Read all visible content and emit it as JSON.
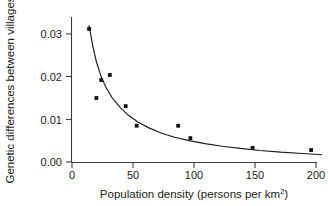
{
  "chart_data": {
    "type": "scatter",
    "title": "",
    "xlabel": "Population density (persons per km2)",
    "xlabel_base": "Population density (persons per km",
    "xlabel_sup": "2",
    "xlabel_tail": ")",
    "ylabel": "Genetic differences between villages",
    "xlim": [
      0,
      205
    ],
    "ylim": [
      0,
      0.0335
    ],
    "grid": false,
    "legend": "none",
    "xticks": [
      0,
      50,
      100,
      150,
      200
    ],
    "xticklabels": [
      "0",
      "50",
      "100",
      "150",
      "200"
    ],
    "yticks": [
      0.0,
      0.01,
      0.02,
      0.03
    ],
    "yticklabels": [
      "0.00",
      "0.01",
      "0.02",
      "0.03"
    ],
    "points": [
      {
        "x": 14,
        "y": 0.0312
      },
      {
        "x": 20,
        "y": 0.015
      },
      {
        "x": 24,
        "y": 0.0192
      },
      {
        "x": 31,
        "y": 0.0204
      },
      {
        "x": 44,
        "y": 0.0131
      },
      {
        "x": 53,
        "y": 0.0085
      },
      {
        "x": 87,
        "y": 0.0085
      },
      {
        "x": 97,
        "y": 0.0056
      },
      {
        "x": 148,
        "y": 0.0033
      },
      {
        "x": 196,
        "y": 0.0028
      }
    ],
    "series": [
      {
        "name": "fitted decay curve",
        "x": [
          14,
          17,
          20,
          24,
          28,
          33,
          39,
          46,
          54,
          63,
          73,
          84,
          96,
          109,
          123,
          138,
          154,
          171,
          189,
          205
        ],
        "y": [
          0.032,
          0.0272,
          0.0235,
          0.0199,
          0.0174,
          0.015,
          0.0129,
          0.011,
          0.0094,
          0.008,
          0.0068,
          0.0058,
          0.005,
          0.0043,
          0.0037,
          0.0032,
          0.0027,
          0.0023,
          0.002,
          0.0017
        ]
      }
    ]
  },
  "colors": {
    "point": "#111111",
    "line": "#1a1a1a",
    "axis": "#3c3c3c",
    "background": "#ffffff"
  }
}
